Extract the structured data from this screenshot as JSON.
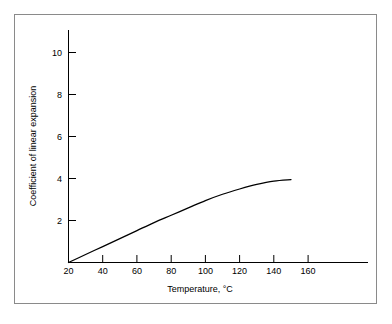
{
  "figure": {
    "background_color": "#ffffff",
    "frame_color": "#8a8a8a",
    "line_color": "#000000"
  },
  "chart_data": {
    "type": "line",
    "title": "",
    "subtitle": "",
    "xlabel": "Temperature, °C",
    "ylabel": "Coefficient of linear expansion",
    "xlim": [
      20,
      170
    ],
    "ylim": [
      0,
      11
    ],
    "xticks": [
      20,
      40,
      60,
      80,
      100,
      120,
      140,
      160
    ],
    "xtick_labels": [
      "20",
      "40",
      "60",
      "80",
      "100",
      "120",
      "140",
      "160"
    ],
    "yticks": [
      2,
      4,
      6,
      8,
      10
    ],
    "ytick_labels": [
      "2",
      "4",
      "6",
      "8",
      "10"
    ],
    "grid": false,
    "legend": false,
    "legend_position": "none",
    "series": [
      {
        "name": "Coefficient of linear expansion",
        "x": [
          20,
          30,
          40,
          50,
          60,
          70,
          80,
          90,
          100,
          110,
          120,
          130,
          140,
          150
        ],
        "values": [
          0.0,
          0.38,
          0.76,
          1.14,
          1.52,
          1.9,
          2.25,
          2.6,
          2.95,
          3.25,
          3.5,
          3.72,
          3.88,
          3.95
        ]
      }
    ],
    "annotations": []
  },
  "axes": {
    "x_axis_name": "x-axis",
    "y_axis_name": "y-axis"
  }
}
